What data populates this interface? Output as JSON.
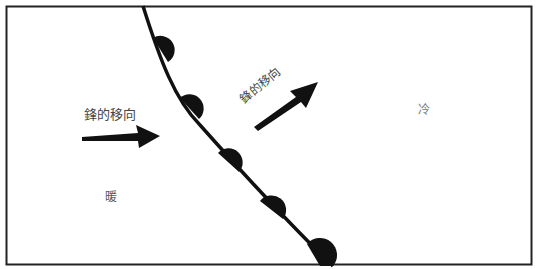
{
  "diagram": {
    "type": "warm-front-weather-symbol",
    "labels": {
      "front_movement_left": "鋒的移向",
      "front_movement_right": "鋒的移向",
      "cold_air": "冷",
      "warm_air": "暖"
    },
    "front": {
      "symbol": "semicircles",
      "semicircle_count": 5,
      "color": "#111111"
    },
    "arrows": [
      {
        "name": "left-movement-arrow",
        "direction": "east"
      },
      {
        "name": "right-movement-arrow",
        "direction": "northeast"
      }
    ],
    "frame_color": "#222222",
    "background": "#ffffff"
  }
}
